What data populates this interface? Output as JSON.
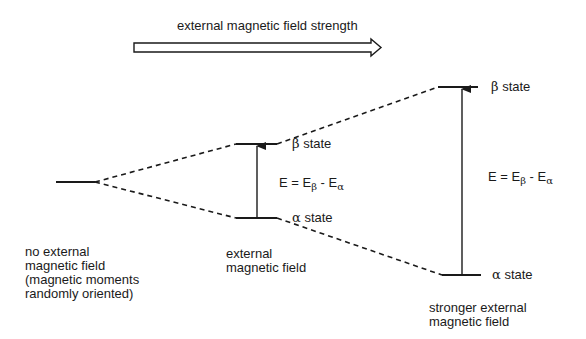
{
  "header": {
    "title": "external magnetic field strength"
  },
  "columns": [
    {
      "id": "no-field",
      "caption": "no external\nmagnetic field\n(magnetic moments\nrandomly oriented)",
      "levels": [
        {
          "label": "",
          "y": 182
        }
      ]
    },
    {
      "id": "field",
      "caption": "external\nmagnetic field",
      "levels": [
        {
          "state": "β",
          "label_suffix": " state",
          "y": 144
        },
        {
          "state": "α",
          "label_suffix": " state",
          "y": 218
        }
      ],
      "energy_label": {
        "prefix": "E = E",
        "sub1": "β",
        "mid": " - E",
        "sub2": "α"
      }
    },
    {
      "id": "strong-field",
      "caption": "stronger external\nmagnetic field",
      "levels": [
        {
          "state": "β",
          "label_suffix": " state",
          "y": 87
        },
        {
          "state": "α",
          "label_suffix": " state",
          "y": 275
        }
      ],
      "energy_label": {
        "prefix": "E = E",
        "sub1": "β",
        "mid": " - E",
        "sub2": "α"
      }
    }
  ],
  "colors": {
    "line": "#1a1a1a",
    "background": "#ffffff"
  }
}
